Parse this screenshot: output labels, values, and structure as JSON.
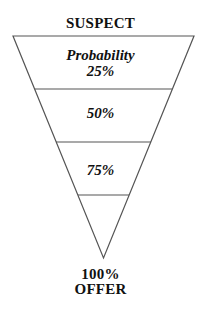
{
  "diagram": {
    "type": "funnel",
    "top_label": "SUSPECT",
    "bottom_labels": [
      "100%",
      "OFFER"
    ],
    "stages": [
      {
        "lines": [
          "Probability",
          "25%"
        ]
      },
      {
        "lines": [
          "50%"
        ]
      },
      {
        "lines": [
          "75%"
        ]
      },
      {
        "lines": []
      }
    ],
    "colors": {
      "line": "#555555",
      "text": "#111111",
      "background": "#ffffff"
    }
  }
}
